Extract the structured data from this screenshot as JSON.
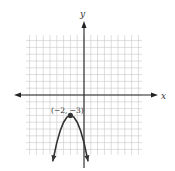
{
  "chart_data": {
    "type": "line",
    "title": "",
    "xlabel": "x",
    "ylabel": "y",
    "function": "y = -(x + 2)^2 - 3",
    "vertex": {
      "x": -2,
      "y": -3,
      "label": "(−2, −3)"
    },
    "xlim": [
      -8.5,
      8.5
    ],
    "ylim": [
      -8.8,
      8.8
    ],
    "grid": true,
    "grid_step": 1,
    "series": [
      {
        "name": "parabola",
        "x": [
          -4.6,
          -4,
          -3.5,
          -3,
          -2.5,
          -2,
          -1.5,
          -1,
          -0.5,
          0,
          0.6
        ],
        "y": [
          -9.76,
          -7,
          -5.25,
          -4,
          -3.25,
          -3,
          -3.25,
          -4,
          -5.25,
          -7,
          -9.76
        ]
      }
    ],
    "legend": null
  },
  "axes": {
    "x_label": "x",
    "y_label": "y"
  },
  "annotations": {
    "vertex_label": "(−2, −3)"
  },
  "colors": {
    "grid": "#c8c8c8",
    "axis": "#222222",
    "curve": "#333333",
    "point": "#333333"
  }
}
